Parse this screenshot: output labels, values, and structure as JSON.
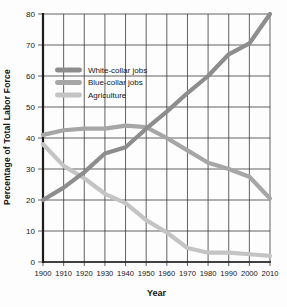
{
  "chart_data": {
    "type": "line",
    "title": "",
    "xlabel": "Year",
    "ylabel": "Percentage of Total Labor Force",
    "xlim": [
      1900,
      2010
    ],
    "ylim": [
      0,
      80
    ],
    "x": [
      1900,
      1910,
      1920,
      1930,
      1940,
      1950,
      1960,
      1970,
      1980,
      1990,
      2000,
      2010
    ],
    "x_tick_labels": [
      "1900",
      "1910",
      "1920",
      "1930",
      "1940",
      "1950",
      "1960",
      "1970",
      "1980",
      "1990",
      "2000",
      "2010"
    ],
    "y_ticks": [
      0,
      10,
      20,
      30,
      40,
      50,
      60,
      70,
      80
    ],
    "grid": true,
    "legend_position": "upper-left-inside",
    "series": [
      {
        "name": "White-collar jobs",
        "color": "#8d8d8d",
        "values": [
          20,
          24,
          29,
          35,
          37,
          43,
          48.5,
          54.5,
          60,
          67,
          70.5,
          80
        ]
      },
      {
        "name": "Blue-collar jobs",
        "color": "#a6a6a6",
        "values": [
          41,
          42.5,
          43,
          43,
          44,
          43.5,
          40,
          36,
          32,
          30,
          27.5,
          20.5
        ]
      },
      {
        "name": "Agriculture",
        "color": "#c4c4c4",
        "values": [
          38,
          31,
          27,
          22,
          19,
          13.5,
          9.5,
          4.5,
          3,
          3,
          2.5,
          2
        ]
      }
    ]
  },
  "colors": {
    "grid": "#3a3a3a",
    "axis": "#1c1c1c",
    "text": "#151515"
  }
}
